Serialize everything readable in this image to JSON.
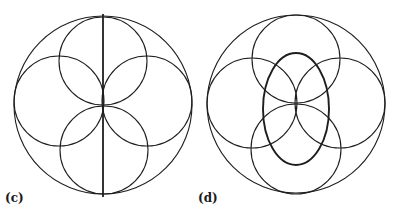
{
  "figures": [
    {
      "label": "(c)",
      "outer_circle": {
        "cx": 103,
        "cy": 105,
        "r": 89
      },
      "inner_circles": [
        {
          "position": "top",
          "cx": 103,
          "cy": 61,
          "r": 44
        },
        {
          "position": "left",
          "cx": 59,
          "cy": 101,
          "r": 45
        },
        {
          "position": "right",
          "cx": 147,
          "cy": 101,
          "r": 45
        },
        {
          "position": "bottom",
          "cx": 104,
          "cy": 150,
          "r": 44
        }
      ],
      "vertical_line": {
        "x1": 103,
        "y1": 14,
        "x2": 103,
        "y2": 197
      }
    },
    {
      "label": "(d)",
      "outer_circle": {
        "cx": 296,
        "cy": 104,
        "r": 89
      },
      "inner_circles": [
        {
          "position": "top",
          "cx": 296,
          "cy": 59,
          "r": 44
        },
        {
          "position": "left",
          "cx": 252,
          "cy": 103,
          "r": 45
        },
        {
          "position": "right",
          "cx": 340,
          "cy": 103,
          "r": 45
        },
        {
          "position": "bottom",
          "cx": 296,
          "cy": 149,
          "r": 45
        }
      ],
      "ellipse": {
        "cx": 296,
        "cy": 109,
        "rx": 33,
        "ry": 56
      }
    }
  ],
  "colors": {
    "stroke": "#1e1e1e",
    "background": "#ffffff"
  }
}
